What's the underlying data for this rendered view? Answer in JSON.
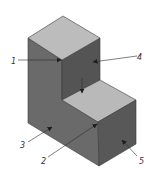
{
  "diagram": {
    "title": "",
    "type": "isometric L-shaped block with numbered surface callouts",
    "colors": {
      "background": "#ffffff",
      "top_face": "#b9b9b9",
      "left_face": "#6a6a6a",
      "right_face": "#575757",
      "inner_face": "#4f4f4f",
      "edge": "#3a3a3a",
      "leader": "#2b2b2b"
    },
    "labels": [
      {
        "id": "1",
        "text": "1",
        "target": "inner corner of upper block top face"
      },
      {
        "id": "2",
        "text": "2",
        "target": "front vertical edge of lower step"
      },
      {
        "id": "3",
        "text": "3",
        "target": "left (front-left) face"
      },
      {
        "id": "4",
        "text": "4",
        "target": "inner vertical face of upper block"
      },
      {
        "id": "5",
        "text": "5",
        "target": "right face of lower step"
      }
    ]
  }
}
